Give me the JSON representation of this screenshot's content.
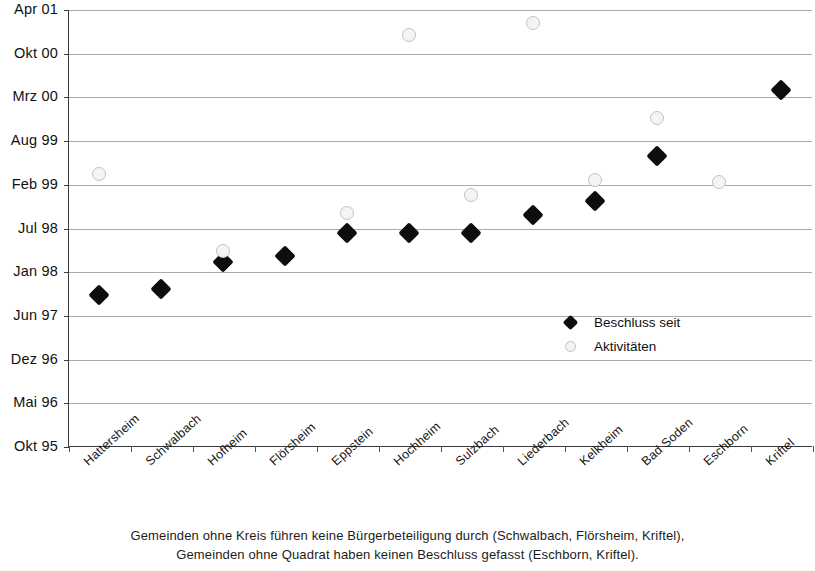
{
  "chart_data": {
    "type": "scatter",
    "title": "",
    "xlabel": "",
    "ylabel": "",
    "grid": true,
    "legend_position": "inside-right",
    "categories": [
      "Hattersheim",
      "Schwalbach",
      "Hofheim",
      "Flörsheim",
      "Eppstein",
      "Hochheim",
      "Sulzbach",
      "Liederbach",
      "Kelkheim",
      "Bad Soden",
      "Eschborn",
      "Kriftel"
    ],
    "ytick_labels": [
      "Apr 01",
      "Okt 00",
      "Mrz 00",
      "Aug 99",
      "Feb 99",
      "Jul 98",
      "Jan 98",
      "Jun 97",
      "Dez 96",
      "Mai 96",
      "Okt 95"
    ],
    "ytick_values": [
      10,
      9,
      8,
      7,
      6,
      5,
      4,
      3,
      2,
      1,
      0
    ],
    "ylim": [
      0,
      10
    ],
    "series": [
      {
        "name": "Beschluss seit",
        "marker": "filled-diamond",
        "color": "#0d0d0d",
        "values": [
          3.48,
          3.62,
          4.23,
          4.37,
          4.9,
          4.9,
          4.9,
          5.3,
          5.62,
          6.67,
          null,
          8.16
        ]
      },
      {
        "name": "Aktivitäten",
        "marker": "open-circle",
        "color": "#f4f4f4",
        "values": [
          6.25,
          null,
          4.48,
          null,
          5.35,
          9.43,
          5.77,
          9.7,
          6.1,
          7.54,
          6.07,
          null
        ]
      }
    ]
  },
  "legend": {
    "items": [
      {
        "label": "Beschluss seit",
        "marker": "filled-diamond"
      },
      {
        "label": "Aktivitäten",
        "marker": "open-circle"
      }
    ]
  },
  "caption": {
    "line1": "Gemeinden ohne Kreis führen keine Bürgerbeteiligung durch (Schwalbach, Flörsheim, Kriftel),",
    "line2": "Gemeinden ohne Quadrat haben keinen Beschluss gefasst (Eschborn, Kriftel)."
  }
}
